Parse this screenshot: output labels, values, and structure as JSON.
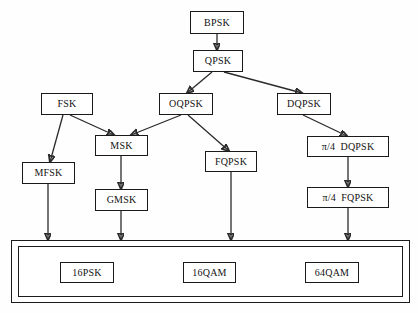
{
  "diagram": {
    "type": "tree-flowchart",
    "stroke_color": "#2b2b2b",
    "box_border_color": "#1a1a1a",
    "background_color": "#ffffff",
    "nodes": [
      {
        "id": "bpsk",
        "label": "BPSK",
        "x": 190,
        "y": 11,
        "w": 54,
        "h": 23
      },
      {
        "id": "qpsk",
        "label": "QPSK",
        "x": 193,
        "y": 50,
        "w": 50,
        "h": 22
      },
      {
        "id": "fsk",
        "label": "FSK",
        "x": 41,
        "y": 93,
        "w": 52,
        "h": 22
      },
      {
        "id": "oqpsk",
        "label": "OQPSK",
        "x": 159,
        "y": 93,
        "w": 54,
        "h": 22
      },
      {
        "id": "dqpsk",
        "label": "DQPSK",
        "x": 277,
        "y": 93,
        "w": 54,
        "h": 22
      },
      {
        "id": "msk",
        "label": "MSK",
        "x": 95,
        "y": 135,
        "w": 53,
        "h": 21
      },
      {
        "id": "pi4dqpsk",
        "label": "π/4  DQPSK",
        "x": 307,
        "y": 136,
        "w": 82,
        "h": 21
      },
      {
        "id": "fqpsk",
        "label": "FQPSK",
        "x": 205,
        "y": 151,
        "w": 52,
        "h": 21
      },
      {
        "id": "mfsk",
        "label": "MFSK",
        "x": 22,
        "y": 162,
        "w": 53,
        "h": 22
      },
      {
        "id": "gmsk",
        "label": "GMSK",
        "x": 95,
        "y": 189,
        "w": 53,
        "h": 22
      },
      {
        "id": "pi4fqpsk",
        "label": "π/4  FQPSK",
        "x": 307,
        "y": 187,
        "w": 82,
        "h": 21
      },
      {
        "id": "16psk",
        "label": "16PSK",
        "x": 60,
        "y": 262,
        "w": 54,
        "h": 21
      },
      {
        "id": "16qam",
        "label": "16QAM",
        "x": 183,
        "y": 262,
        "w": 53,
        "h": 21
      },
      {
        "id": "64qam",
        "label": "64QAM",
        "x": 305,
        "y": 262,
        "w": 54,
        "h": 21
      }
    ],
    "group": {
      "id": "higher-order-group",
      "outer": {
        "x": 11,
        "y": 240,
        "w": 399,
        "h": 63
      },
      "inner": {
        "x": 18,
        "y": 246,
        "w": 385,
        "h": 51
      },
      "members": [
        "16PSK",
        "16QAM",
        "64QAM"
      ]
    },
    "edges": [
      {
        "from": "bpsk",
        "to": "qpsk",
        "kind": "vertical",
        "x1": 217,
        "y1": 34,
        "x2": 217,
        "y2": 50
      },
      {
        "from": "qpsk",
        "to": "oqpsk",
        "kind": "diagonal",
        "x1": 212,
        "y1": 72,
        "x2": 187,
        "y2": 93
      },
      {
        "from": "qpsk",
        "to": "dqpsk",
        "kind": "diagonal",
        "x1": 224,
        "y1": 72,
        "x2": 302,
        "y2": 93
      },
      {
        "from": "fsk",
        "to": "mfsk",
        "kind": "diagonal",
        "x1": 63,
        "y1": 115,
        "x2": 50,
        "y2": 162
      },
      {
        "from": "fsk",
        "to": "msk",
        "kind": "diagonal",
        "x1": 70,
        "y1": 115,
        "x2": 114,
        "y2": 135
      },
      {
        "from": "oqpsk",
        "to": "msk",
        "kind": "diagonal",
        "x1": 181,
        "y1": 115,
        "x2": 131,
        "y2": 135
      },
      {
        "from": "oqpsk",
        "to": "fqpsk",
        "kind": "diagonal",
        "x1": 188,
        "y1": 115,
        "x2": 229,
        "y2": 151
      },
      {
        "from": "dqpsk",
        "to": "pi4dqpsk",
        "kind": "diagonal",
        "x1": 303,
        "y1": 115,
        "x2": 347,
        "y2": 136
      },
      {
        "from": "msk",
        "to": "gmsk",
        "kind": "vertical",
        "x1": 121,
        "y1": 156,
        "x2": 121,
        "y2": 189
      },
      {
        "from": "pi4dqpsk",
        "to": "pi4fqpsk",
        "kind": "vertical",
        "x1": 348,
        "y1": 157,
        "x2": 348,
        "y2": 187
      },
      {
        "from": "mfsk",
        "to": "group",
        "kind": "vertical",
        "x1": 48,
        "y1": 184,
        "x2": 48,
        "y2": 240
      },
      {
        "from": "gmsk",
        "to": "group",
        "kind": "vertical",
        "x1": 121,
        "y1": 211,
        "x2": 121,
        "y2": 240
      },
      {
        "from": "fqpsk",
        "to": "group",
        "kind": "vertical",
        "x1": 231,
        "y1": 172,
        "x2": 231,
        "y2": 240
      },
      {
        "from": "pi4fqpsk",
        "to": "group",
        "kind": "vertical",
        "x1": 348,
        "y1": 208,
        "x2": 348,
        "y2": 240
      }
    ]
  }
}
